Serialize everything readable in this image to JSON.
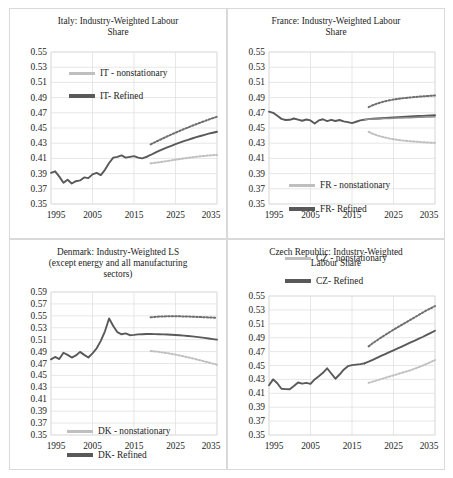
{
  "figure": {
    "background": "#ffffff",
    "panel_border_color": "#d9d9d9",
    "grid_color": "#dcdcdc",
    "refined_color": "#595959",
    "nonstationary_color": "#bfbfbf"
  },
  "chart_data": [
    {
      "id": "italy",
      "type": "line",
      "title": "Italy: Industry-Weighted Labour\nShare",
      "xlabel": "",
      "ylabel": "",
      "xlim": [
        1995,
        2035
      ],
      "ylim": [
        0.35,
        0.55
      ],
      "ytick_labels": [
        "0.55",
        "0.53",
        "0.51",
        "0.49",
        "0.47",
        "0.45",
        "0.43",
        "0.41",
        "0.39",
        "0.37",
        "0.35"
      ],
      "ytick_values": [
        0.55,
        0.53,
        0.51,
        0.49,
        0.47,
        0.45,
        0.43,
        0.41,
        0.39,
        0.37,
        0.35
      ],
      "xtick_labels": [
        "1995",
        "2005",
        "2015",
        "2025",
        "2035"
      ],
      "xtick_values": [
        1995,
        2005,
        2015,
        2025,
        2035
      ],
      "grid": true,
      "legend_position": "top-left-inside",
      "legend": [
        {
          "name": "IT - nonstationary",
          "style": "line-light"
        },
        {
          "name": "IT- Refined",
          "style": "line-dark"
        }
      ],
      "series": [
        {
          "name": "historical",
          "style": "solid-dark",
          "x": [
            1995,
            1996,
            1997,
            1998,
            1999,
            2000,
            2001,
            2002,
            2003,
            2004,
            2005,
            2006,
            2007,
            2008,
            2009,
            2010,
            2011,
            2012,
            2013,
            2014,
            2015,
            2016,
            2017,
            2018
          ],
          "values": [
            0.391,
            0.393,
            0.386,
            0.378,
            0.382,
            0.377,
            0.38,
            0.381,
            0.385,
            0.384,
            0.389,
            0.391,
            0.388,
            0.395,
            0.404,
            0.411,
            0.412,
            0.414,
            0.411,
            0.412,
            0.413,
            0.411,
            0.41,
            0.412
          ]
        },
        {
          "name": "IT- Refined",
          "style": "solid-dark",
          "x": [
            2018,
            2019,
            2020,
            2021,
            2022,
            2023,
            2024,
            2025,
            2026,
            2027,
            2028,
            2029,
            2030,
            2031,
            2032,
            2033,
            2034,
            2035
          ],
          "values": [
            0.412,
            0.4145,
            0.4172,
            0.4198,
            0.4222,
            0.4245,
            0.4266,
            0.4287,
            0.4307,
            0.4326,
            0.4344,
            0.4362,
            0.4379,
            0.4395,
            0.441,
            0.4425,
            0.4438,
            0.445
          ]
        },
        {
          "name": "IT- Refined upper band",
          "style": "dotted-dark",
          "x": [
            2019,
            2020,
            2021,
            2022,
            2023,
            2024,
            2025,
            2026,
            2027,
            2028,
            2029,
            2030,
            2031,
            2032,
            2033,
            2034,
            2035
          ],
          "values": [
            0.4285,
            0.4312,
            0.4338,
            0.4364,
            0.439,
            0.4414,
            0.4438,
            0.4462,
            0.4485,
            0.4507,
            0.4529,
            0.455,
            0.4571,
            0.4591,
            0.4611,
            0.463,
            0.4648
          ]
        },
        {
          "name": "IT - nonstationary lower band",
          "style": "dotted-light",
          "x": [
            2019,
            2020,
            2021,
            2022,
            2023,
            2024,
            2025,
            2026,
            2027,
            2028,
            2029,
            2030,
            2031,
            2032,
            2033,
            2034,
            2035
          ],
          "values": [
            0.4035,
            0.4042,
            0.405,
            0.4058,
            0.4066,
            0.4074,
            0.4083,
            0.4091,
            0.4099,
            0.4107,
            0.4114,
            0.4121,
            0.4127,
            0.4133,
            0.4138,
            0.4142,
            0.4145
          ]
        }
      ]
    },
    {
      "id": "france",
      "type": "line",
      "title": "France: Industry-Weighted Labour\nShare",
      "xlabel": "",
      "ylabel": "",
      "xlim": [
        1995,
        2035
      ],
      "ylim": [
        0.35,
        0.55
      ],
      "ytick_labels": [
        "0.55",
        "0.53",
        "0.51",
        "0.49",
        "0.47",
        "0.45",
        "0.43",
        "0.41",
        "0.39",
        "0.37",
        "0.35"
      ],
      "ytick_values": [
        0.55,
        0.53,
        0.51,
        0.49,
        0.47,
        0.45,
        0.43,
        0.41,
        0.39,
        0.37,
        0.35
      ],
      "xtick_labels": [
        "1995",
        "2005",
        "2015",
        "2025",
        "2035"
      ],
      "xtick_values": [
        1995,
        2005,
        2015,
        2025,
        2035
      ],
      "grid": true,
      "legend_position": "bottom-left-inside",
      "legend": [
        {
          "name": "FR - nonstationary",
          "style": "line-light"
        },
        {
          "name": "FR- Refined",
          "style": "line-dark"
        }
      ],
      "series": [
        {
          "name": "historical",
          "style": "solid-dark",
          "x": [
            1995,
            1996,
            1997,
            1998,
            1999,
            2000,
            2001,
            2002,
            2003,
            2004,
            2005,
            2006,
            2007,
            2008,
            2009,
            2010,
            2011,
            2012,
            2013,
            2014,
            2015,
            2016,
            2017,
            2018
          ],
          "values": [
            0.4715,
            0.47,
            0.466,
            0.462,
            0.4605,
            0.4608,
            0.4625,
            0.461,
            0.4595,
            0.4612,
            0.46,
            0.456,
            0.46,
            0.4615,
            0.459,
            0.4608,
            0.4592,
            0.4605,
            0.4588,
            0.4578,
            0.4565,
            0.4582,
            0.46,
            0.461
          ]
        },
        {
          "name": "FR- Refined",
          "style": "solid-dark",
          "x": [
            2018,
            2019,
            2020,
            2021,
            2022,
            2023,
            2024,
            2025,
            2026,
            2027,
            2028,
            2029,
            2030,
            2031,
            2032,
            2033,
            2034,
            2035
          ],
          "values": [
            0.461,
            0.4616,
            0.4621,
            0.4625,
            0.4629,
            0.4633,
            0.4636,
            0.464,
            0.4643,
            0.4646,
            0.4649,
            0.4652,
            0.4655,
            0.4658,
            0.466,
            0.4663,
            0.4665,
            0.4668
          ]
        },
        {
          "name": "FR - nonstationary",
          "style": "solid-light",
          "x": [
            2018,
            2019,
            2020,
            2021,
            2022,
            2023,
            2024,
            2025,
            2026,
            2027,
            2028,
            2029,
            2030,
            2031,
            2032,
            2033,
            2034,
            2035
          ],
          "values": [
            0.461,
            0.4614,
            0.4617,
            0.462,
            0.4622,
            0.4624,
            0.4626,
            0.4628,
            0.463,
            0.4632,
            0.4634,
            0.4636,
            0.4638,
            0.464,
            0.4642,
            0.4644,
            0.4646,
            0.4648
          ]
        },
        {
          "name": "upper band",
          "style": "dotted-dark",
          "x": [
            2019,
            2020,
            2021,
            2022,
            2023,
            2024,
            2025,
            2026,
            2027,
            2028,
            2029,
            2030,
            2031,
            2032,
            2033,
            2034,
            2035
          ],
          "values": [
            0.4775,
            0.48,
            0.482,
            0.4838,
            0.4852,
            0.4864,
            0.4874,
            0.4882,
            0.489,
            0.4896,
            0.4902,
            0.4907,
            0.4912,
            0.4916,
            0.492,
            0.4924,
            0.4928
          ]
        },
        {
          "name": "lower band",
          "style": "dotted-light",
          "x": [
            2019,
            2020,
            2021,
            2022,
            2023,
            2024,
            2025,
            2026,
            2027,
            2028,
            2029,
            2030,
            2031,
            2032,
            2033,
            2034,
            2035
          ],
          "values": [
            0.445,
            0.4424,
            0.4404,
            0.4388,
            0.4374,
            0.4362,
            0.4352,
            0.4344,
            0.4337,
            0.4331,
            0.4326,
            0.4321,
            0.4317,
            0.4313,
            0.431,
            0.4307,
            0.4305
          ]
        }
      ]
    },
    {
      "id": "denmark",
      "type": "line",
      "title": "Denmark: Industry-Weighted LS\n(except energy and all manufacturing\nsectors)",
      "xlabel": "",
      "ylabel": "",
      "xlim": [
        1995,
        2035
      ],
      "ylim": [
        0.35,
        0.59
      ],
      "ytick_labels": [
        "0.59",
        "0.57",
        "0.55",
        "0.53",
        "0.51",
        "0.49",
        "0.47",
        "0.45",
        "0.43",
        "0.41",
        "0.39",
        "0.37",
        "0.35"
      ],
      "ytick_values": [
        0.59,
        0.57,
        0.55,
        0.53,
        0.51,
        0.49,
        0.47,
        0.45,
        0.43,
        0.41,
        0.39,
        0.37,
        0.35
      ],
      "xtick_labels": [
        "1995",
        "2005",
        "2015",
        "2025",
        "2035"
      ],
      "xtick_values": [
        1995,
        2005,
        2015,
        2025,
        2035
      ],
      "grid": true,
      "legend_position": "bottom-left-inside",
      "legend": [
        {
          "name": "DK - nonstationary",
          "style": "line-light"
        },
        {
          "name": "DK- Refined",
          "style": "line-dark"
        }
      ],
      "series": [
        {
          "name": "historical",
          "style": "solid-dark",
          "x": [
            1995,
            1996,
            1997,
            1998,
            1999,
            2000,
            2001,
            2002,
            2003,
            2004,
            2005,
            2006,
            2007,
            2008,
            2009,
            2010,
            2011,
            2012,
            2013,
            2014,
            2015,
            2016,
            2017,
            2018
          ],
          "values": [
            0.477,
            0.481,
            0.4775,
            0.488,
            0.4845,
            0.48,
            0.4835,
            0.4895,
            0.4845,
            0.48,
            0.487,
            0.4955,
            0.508,
            0.524,
            0.5455,
            0.533,
            0.5225,
            0.519,
            0.5205,
            0.5175,
            0.518,
            0.5188,
            0.5192,
            0.5195
          ]
        },
        {
          "name": "DK- Refined",
          "style": "solid-dark",
          "x": [
            2018,
            2019,
            2020,
            2021,
            2022,
            2023,
            2024,
            2025,
            2026,
            2027,
            2028,
            2029,
            2030,
            2031,
            2032,
            2033,
            2034,
            2035
          ],
          "values": [
            0.5195,
            0.5194,
            0.5193,
            0.5191,
            0.5189,
            0.5186,
            0.5183,
            0.5179,
            0.5174,
            0.5168,
            0.5162,
            0.5155,
            0.5147,
            0.5139,
            0.513,
            0.512,
            0.511,
            0.51
          ]
        },
        {
          "name": "upper band",
          "style": "dotted-dark",
          "x": [
            2019,
            2020,
            2021,
            2022,
            2023,
            2024,
            2025,
            2026,
            2027,
            2028,
            2029,
            2030,
            2031,
            2032,
            2033,
            2034,
            2035
          ],
          "values": [
            0.5475,
            0.5482,
            0.5487,
            0.549,
            0.5492,
            0.5493,
            0.5493,
            0.5492,
            0.549,
            0.5488,
            0.5485,
            0.5482,
            0.5479,
            0.5476,
            0.5473,
            0.547,
            0.5468
          ]
        },
        {
          "name": "lower band",
          "style": "dotted-light",
          "x": [
            2019,
            2020,
            2021,
            2022,
            2023,
            2024,
            2025,
            2026,
            2027,
            2028,
            2029,
            2030,
            2031,
            2032,
            2033,
            2034,
            2035
          ],
          "values": [
            0.491,
            0.4903,
            0.4895,
            0.4885,
            0.4874,
            0.4862,
            0.4849,
            0.4835,
            0.482,
            0.4804,
            0.4788,
            0.4771,
            0.4753,
            0.4735,
            0.4717,
            0.4698,
            0.468
          ]
        }
      ]
    },
    {
      "id": "czech",
      "type": "line",
      "title": "Czech Republic: Industry-Weighted\nLabour Share",
      "xlabel": "",
      "ylabel": "",
      "xlim": [
        1995,
        2035
      ],
      "ylim": [
        0.35,
        0.55
      ],
      "ytick_labels": [
        "0.55",
        "0.53",
        "0.51",
        "0.49",
        "0.47",
        "0.45",
        "0.43",
        "0.41",
        "0.39",
        "0.37",
        "0.35"
      ],
      "ytick_values": [
        0.55,
        0.53,
        0.51,
        0.49,
        0.47,
        0.45,
        0.43,
        0.41,
        0.39,
        0.37,
        0.35
      ],
      "xtick_labels": [
        "1995",
        "2005",
        "2015",
        "2025",
        "2035"
      ],
      "xtick_values": [
        1995,
        2005,
        2015,
        2025,
        2035
      ],
      "grid": true,
      "legend_position": "above-plot",
      "legend": [
        {
          "name": "CZ - nonstationary",
          "style": "line-light"
        },
        {
          "name": "CZ- Refined",
          "style": "line-dark"
        }
      ],
      "series": [
        {
          "name": "historical",
          "style": "solid-dark",
          "x": [
            1995,
            1996,
            1997,
            1998,
            1999,
            2000,
            2001,
            2002,
            2003,
            2004,
            2005,
            2006,
            2007,
            2008,
            2009,
            2010,
            2011,
            2012,
            2013,
            2014,
            2015,
            2016,
            2017,
            2018
          ],
          "values": [
            0.4215,
            0.43,
            0.4245,
            0.4165,
            0.416,
            0.4158,
            0.4205,
            0.4255,
            0.424,
            0.425,
            0.4235,
            0.43,
            0.4345,
            0.4395,
            0.446,
            0.4385,
            0.431,
            0.437,
            0.444,
            0.449,
            0.4505,
            0.4512,
            0.452,
            0.453
          ]
        },
        {
          "name": "CZ- Refined",
          "style": "solid-dark",
          "x": [
            2018,
            2019,
            2020,
            2021,
            2022,
            2023,
            2024,
            2025,
            2026,
            2027,
            2028,
            2029,
            2030,
            2031,
            2032,
            2033,
            2034,
            2035
          ],
          "values": [
            0.453,
            0.4555,
            0.4582,
            0.461,
            0.4638,
            0.4665,
            0.4692,
            0.4718,
            0.4745,
            0.4772,
            0.48,
            0.4828,
            0.4855,
            0.4882,
            0.491,
            0.494,
            0.497,
            0.5
          ]
        },
        {
          "name": "upper band",
          "style": "dotted-dark",
          "x": [
            2019,
            2020,
            2021,
            2022,
            2023,
            2024,
            2025,
            2026,
            2027,
            2028,
            2029,
            2030,
            2031,
            2032,
            2033,
            2034,
            2035
          ],
          "values": [
            0.4775,
            0.482,
            0.4862,
            0.4902,
            0.494,
            0.4978,
            0.5015,
            0.505,
            0.5085,
            0.512,
            0.5155,
            0.519,
            0.5225,
            0.526,
            0.5295,
            0.5325,
            0.5355
          ]
        },
        {
          "name": "lower band",
          "style": "dotted-light",
          "x": [
            2019,
            2020,
            2021,
            2022,
            2023,
            2024,
            2025,
            2026,
            2027,
            2028,
            2029,
            2030,
            2031,
            2032,
            2033,
            2034,
            2035
          ],
          "values": [
            0.425,
            0.4268,
            0.4286,
            0.4304,
            0.4322,
            0.434,
            0.4358,
            0.4376,
            0.4394,
            0.4412,
            0.443,
            0.4452,
            0.4474,
            0.4498,
            0.4524,
            0.455,
            0.4578
          ]
        }
      ]
    }
  ]
}
